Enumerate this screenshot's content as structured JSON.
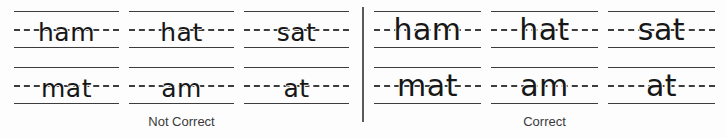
{
  "worksheet": {
    "title": "Handwriting letter-size comparison",
    "background_color": "#fdfdfd",
    "rule_color": "#3c3c3c",
    "ink_color": "#171717",
    "divider_color": "#5a5a5a"
  },
  "panels": [
    {
      "id": "not-correct",
      "caption": "Not Correct",
      "rows": [
        {
          "words": [
            "ham",
            "hat",
            "sat"
          ]
        },
        {
          "words": [
            "mat",
            "am",
            "at"
          ]
        }
      ]
    },
    {
      "id": "correct",
      "caption": "Correct",
      "rows": [
        {
          "words": [
            "ham",
            "hat",
            "sat"
          ]
        },
        {
          "words": [
            "mat",
            "am",
            "at"
          ]
        }
      ]
    }
  ]
}
